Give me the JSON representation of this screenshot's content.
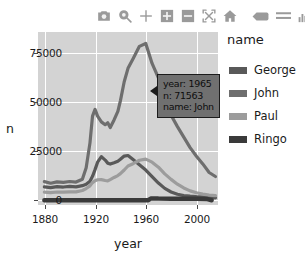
{
  "modebar": {
    "buttons": [
      {
        "name": "camera-icon",
        "label": "Download plot as png"
      },
      {
        "name": "zoom-icon",
        "label": "Zoom"
      },
      {
        "name": "pan-icon",
        "label": "Pan"
      },
      {
        "name": "zoom-in-icon",
        "label": "Zoom in"
      },
      {
        "name": "zoom-out-icon",
        "label": "Zoom out"
      },
      {
        "name": "autoscale-icon",
        "label": "Autoscale"
      },
      {
        "name": "home-icon",
        "label": "Reset axes"
      },
      {
        "name": "spike-lines-icon",
        "label": "Toggle spike lines"
      },
      {
        "name": "compare-data-icon",
        "label": "Compare data on hover"
      },
      {
        "name": "plotly-logo-icon",
        "label": "Produced with Plotly"
      }
    ]
  },
  "legend": {
    "title": "name",
    "items": [
      {
        "label": "George",
        "color": "#595959"
      },
      {
        "label": "John",
        "color": "#6e6e6e"
      },
      {
        "label": "Paul",
        "color": "#9c9c9c"
      },
      {
        "label": "Ringo",
        "color": "#3a3a3a"
      }
    ]
  },
  "tooltip": {
    "lines": [
      "year: 1965",
      "n: 71563",
      "name: John"
    ],
    "bg": "#707070",
    "border": "#1c1c1c"
  },
  "chart_data": {
    "type": "line",
    "title": "",
    "xlabel": "year",
    "ylabel": "n",
    "xlim": [
      1875,
      2017
    ],
    "ylim": [
      -2500,
      88000
    ],
    "xticks": [
      1880,
      1920,
      1960,
      2000
    ],
    "yticks": [
      0,
      25000,
      50000,
      75000
    ],
    "ytick_labels": [
      "0",
      "25000",
      "50000",
      "75000"
    ],
    "grid": true,
    "legend_position": "right",
    "panel_bg": "#d3d3d3",
    "grid_color": "#ffffff",
    "series": [
      {
        "name": "George",
        "color": "#595959",
        "x": [
          1880,
          1885,
          1890,
          1895,
          1900,
          1905,
          1910,
          1913,
          1916,
          1918,
          1920,
          1922,
          1925,
          1928,
          1930,
          1932,
          1935,
          1938,
          1940,
          1943,
          1946,
          1950,
          1955,
          1960,
          1965,
          1970,
          1975,
          1980,
          1985,
          1990,
          1995,
          2000,
          2005,
          2010,
          2015
        ],
        "values": [
          7000,
          6600,
          7100,
          6900,
          7200,
          7000,
          7600,
          8300,
          9900,
          12500,
          16000,
          19900,
          22800,
          21000,
          19400,
          18900,
          19600,
          20400,
          21400,
          23100,
          23400,
          21300,
          18600,
          15800,
          12400,
          9000,
          6200,
          4300,
          3100,
          2400,
          2100,
          1900,
          1800,
          1500,
          1200
        ]
      },
      {
        "name": "John",
        "color": "#6e6e6e",
        "x": [
          1880,
          1885,
          1890,
          1895,
          1900,
          1905,
          1910,
          1913,
          1916,
          1918,
          1920,
          1922,
          1925,
          1928,
          1930,
          1932,
          1935,
          1938,
          1940,
          1943,
          1946,
          1950,
          1955,
          1960,
          1965,
          1970,
          1975,
          1980,
          1985,
          1990,
          1995,
          2000,
          2005,
          2010,
          2015
        ],
        "values": [
          9700,
          8900,
          9600,
          9300,
          9800,
          9500,
          11000,
          17000,
          30000,
          44000,
          47500,
          44000,
          41000,
          39500,
          40500,
          38000,
          42000,
          46500,
          52000,
          62000,
          69000,
          74000,
          80500,
          82000,
          71563,
          64000,
          52000,
          44500,
          38500,
          33000,
          27500,
          23000,
          19000,
          14500,
          12400
        ]
      },
      {
        "name": "Paul",
        "color": "#9c9c9c",
        "x": [
          1880,
          1885,
          1890,
          1895,
          1900,
          1905,
          1910,
          1913,
          1916,
          1918,
          1920,
          1922,
          1925,
          1928,
          1930,
          1932,
          1935,
          1938,
          1940,
          1943,
          1946,
          1950,
          1955,
          1960,
          1965,
          1970,
          1975,
          1980,
          1985,
          1990,
          1995,
          2000,
          2005,
          2010,
          2015
        ],
        "values": [
          4200,
          4000,
          4300,
          4200,
          4400,
          4400,
          5100,
          6100,
          7500,
          9200,
          10200,
          10700,
          10800,
          10300,
          10100,
          10800,
          11900,
          12900,
          13900,
          15800,
          17900,
          19100,
          20900,
          21500,
          19900,
          17300,
          13800,
          10900,
          8400,
          6400,
          4900,
          3900,
          3200,
          2700,
          2400
        ]
      },
      {
        "name": "Ringo",
        "color": "#3a3a3a",
        "x": [
          1880,
          1900,
          1920,
          1940,
          1955,
          1962,
          1964,
          1966,
          1970,
          1980,
          1990,
          2000,
          2008,
          2012
        ],
        "values": [
          0,
          0,
          0,
          0,
          0,
          0,
          900,
          950,
          850,
          800,
          780,
          760,
          700,
          0
        ]
      }
    ]
  }
}
